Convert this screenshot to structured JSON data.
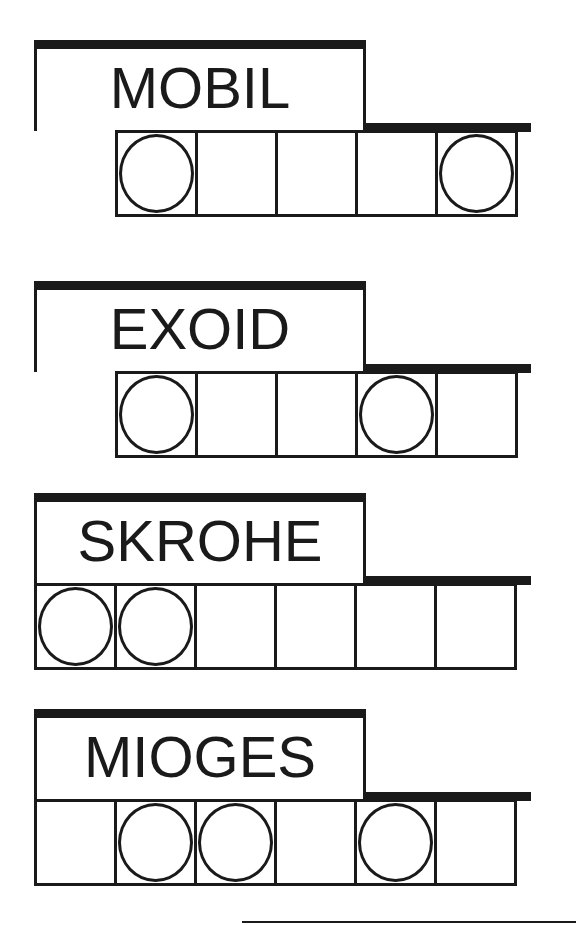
{
  "puzzles": [
    {
      "scrambled": "MOBIL",
      "top": 40,
      "cells_left": 115,
      "cells": [
        {
          "circled": true
        },
        {
          "circled": false
        },
        {
          "circled": false
        },
        {
          "circled": false
        },
        {
          "circled": true
        }
      ]
    },
    {
      "scrambled": "EXOID",
      "top": 281,
      "cells_left": 115,
      "cells": [
        {
          "circled": true
        },
        {
          "circled": false
        },
        {
          "circled": false
        },
        {
          "circled": true
        },
        {
          "circled": false
        }
      ]
    },
    {
      "scrambled": "SKROHE",
      "top": 493,
      "cells_left": 34,
      "cells": [
        {
          "circled": true
        },
        {
          "circled": true
        },
        {
          "circled": false
        },
        {
          "circled": false
        },
        {
          "circled": false
        },
        {
          "circled": false
        }
      ]
    },
    {
      "scrambled": "MIOGES",
      "top": 709,
      "cells_left": 34,
      "cells": [
        {
          "circled": false
        },
        {
          "circled": true
        },
        {
          "circled": true
        },
        {
          "circled": false
        },
        {
          "circled": true
        },
        {
          "circled": false
        }
      ]
    }
  ],
  "answer_line": {
    "visible": true
  },
  "colors": {
    "ink": "#1a1a1a",
    "paper": "#ffffff"
  }
}
